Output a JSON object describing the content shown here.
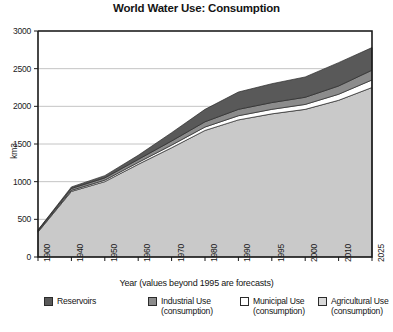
{
  "chart_data": {
    "type": "area",
    "title": "World Water Use: Consumption",
    "xlabel": "Year (values beyond 1995 are forecasts)",
    "ylabel": "km3",
    "ylim": [
      0,
      3000
    ],
    "yticks": [
      0,
      500,
      1000,
      1500,
      2000,
      2500,
      3000
    ],
    "grid": true,
    "legend_position": "bottom",
    "stacked": true,
    "x": [
      1900,
      1940,
      1950,
      1960,
      1970,
      1980,
      1990,
      1995,
      2000,
      2010,
      2025
    ],
    "categories": [
      "1900",
      "1940",
      "1950",
      "1960",
      "1970",
      "1980",
      "1990",
      "1995",
      "2000",
      "2010",
      "2025"
    ],
    "series": [
      {
        "name": "Agricultural Use (consumption)",
        "color": "#c9c9c9",
        "values": [
          330,
          870,
          1000,
          1230,
          1450,
          1680,
          1820,
          1900,
          1960,
          2080,
          2250
        ]
      },
      {
        "name": "Municipal Use (consumption)",
        "color": "#ffffff",
        "values": [
          10,
          15,
          20,
          25,
          35,
          45,
          55,
          60,
          65,
          80,
          100
        ]
      },
      {
        "name": "Industrial Use (consumption)",
        "color": "#8c8c8c",
        "values": [
          15,
          25,
          30,
          40,
          55,
          70,
          85,
          90,
          95,
          110,
          130
        ]
      },
      {
        "name": "Reservoirs",
        "color": "#595959",
        "values": [
          5,
          20,
          30,
          55,
          110,
          165,
          230,
          250,
          270,
          310,
          300
        ]
      }
    ],
    "totals": [
      360,
      930,
      1080,
      1350,
      1650,
      1960,
      2190,
      2300,
      2390,
      2580,
      2780
    ]
  },
  "axis": {
    "y_label": "km3",
    "y_ticks": [
      "3000",
      "2500",
      "2000",
      "1500",
      "1000",
      "500",
      "0"
    ],
    "x_label": "Year (values beyond 1995 are forecasts)",
    "x_ticks": [
      "1900",
      "1940",
      "1950",
      "1960",
      "1970",
      "1980",
      "1990",
      "1995",
      "2000",
      "2010",
      "2025"
    ]
  },
  "legend": {
    "items": [
      {
        "label": "Reservoirs",
        "color": "#595959"
      },
      {
        "label": "Industrial Use\n(consumption)",
        "color": "#8c8c8c"
      },
      {
        "label": "Municipal Use\n(consumption)",
        "color": "#ffffff"
      },
      {
        "label": "Agricultural Use\n(consumption)",
        "color": "#d9d9d9"
      }
    ]
  },
  "colors": {
    "axis": "#1a1a1a",
    "grid": "#b5b5b5",
    "background": "#ffffff",
    "reservoirs": "#595959",
    "industrial": "#8c8c8c",
    "municipal": "#ffffff",
    "agricultural": "#c9c9c9"
  }
}
